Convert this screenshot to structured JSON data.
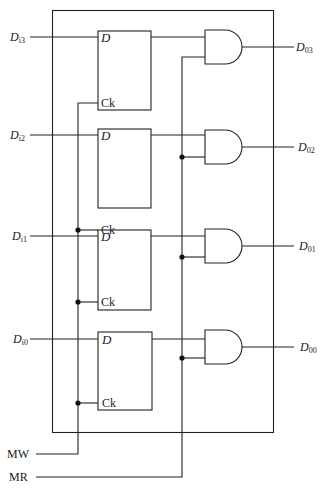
{
  "diagram": {
    "colors": {
      "line": "#222222",
      "background": "#ffffff",
      "text": "#1a1a1a"
    },
    "inputs": [
      {
        "base": "D",
        "sub": "i3"
      },
      {
        "base": "D",
        "sub": "i2"
      },
      {
        "base": "D",
        "sub": "i1"
      },
      {
        "base": "D",
        "sub": "i0"
      }
    ],
    "outputs": [
      {
        "base": "D",
        "sub": "03"
      },
      {
        "base": "D",
        "sub": "02"
      },
      {
        "base": "D",
        "sub": "01"
      },
      {
        "base": "D",
        "sub": "00"
      }
    ],
    "flipflop_pins": {
      "data": "D",
      "clock": "Ck"
    },
    "controls": {
      "write": "MW",
      "read": "MR"
    },
    "gate_type": "AND"
  }
}
